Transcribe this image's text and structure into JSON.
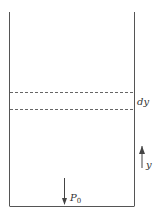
{
  "diagram": {
    "type": "column-of-fluid",
    "labels": {
      "element_thickness": "dy",
      "axis": "y",
      "bottom_pressure": "P",
      "bottom_pressure_subscript": "0"
    },
    "colors": {
      "stroke": "#555555",
      "text": "#333333",
      "background": "#ffffff"
    }
  }
}
